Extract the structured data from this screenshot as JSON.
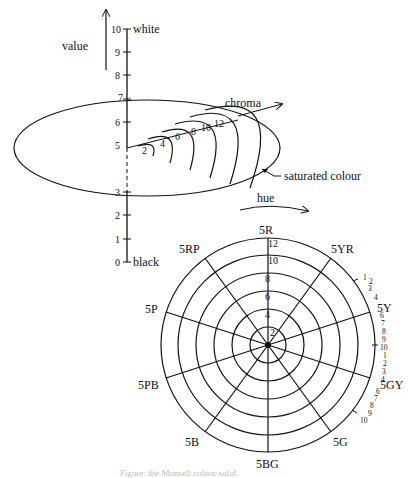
{
  "value_axis": {
    "title": "value",
    "top_label": "white",
    "bottom_label": "black",
    "ticks": [
      "0",
      "1",
      "2",
      "3",
      "4",
      "5",
      "6",
      "7",
      "8",
      "9",
      "10"
    ],
    "visible_ticks": [
      "0",
      "1",
      "2",
      "3",
      "5",
      "6",
      "7",
      "8",
      "9",
      "10"
    ]
  },
  "chroma_section": {
    "title": "chroma",
    "chroma_ticks": [
      "2",
      "4",
      "6",
      "8",
      "10",
      "12"
    ],
    "annotation": "saturated colour"
  },
  "hue_circle": {
    "title": "hue",
    "hues": [
      "5R",
      "5YR",
      "5Y",
      "5GY",
      "5G",
      "5BG",
      "5B",
      "5PB",
      "5P",
      "5RP"
    ],
    "radial_ticks": [
      "2",
      "4",
      "6",
      "8",
      "10",
      "12"
    ],
    "hue_steps_yr_to_y": [
      "1",
      "2",
      "3",
      "4"
    ],
    "hue_steps_y_to_gy": [
      "6",
      "7",
      "8",
      "9",
      "10",
      "1",
      "2",
      "3",
      "4"
    ],
    "hue_steps_gy_to_g": [
      "6",
      "7",
      "8",
      "9",
      "10"
    ]
  },
  "caption": "Figure: the Munsell colour solid"
}
